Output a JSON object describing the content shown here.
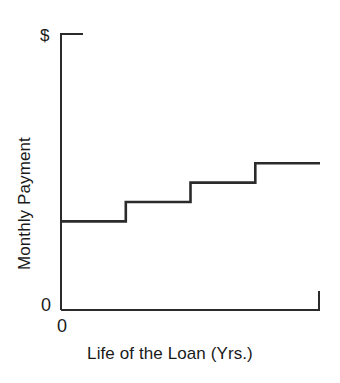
{
  "chart_data": {
    "type": "line",
    "title": "",
    "subtitle": "",
    "xlabel": "Life of the Loan (Yrs.)",
    "ylabel": "Monthly Payment",
    "y_axis_top_tick_label": "$",
    "y_axis_zero_label": "0",
    "x_axis_zero_label": "0",
    "x_tick_labels": [],
    "y_tick_labels": [
      "0",
      "$"
    ],
    "grid": false,
    "legend": null,
    "annotations": [],
    "line_style": "step-post",
    "line_color": "#2b2b2b",
    "axis_color": "#2b2b2b",
    "background_color": "#ffffff",
    "xlim": [
      0,
      4
    ],
    "ylim": [
      0,
      100
    ],
    "x": [
      0,
      1,
      2,
      3,
      4
    ],
    "categories": [
      "Year 1",
      "Year 2",
      "Year 3",
      "Year 4"
    ],
    "values": [
      32,
      39,
      46,
      53
    ],
    "series": [
      {
        "name": "Monthly Payment",
        "values": [
          32,
          39,
          46,
          53
        ]
      }
    ],
    "steps": [
      {
        "index": 1,
        "x_start": 0.0,
        "x_end": 1.0,
        "value": 32
      },
      {
        "index": 2,
        "x_start": 1.0,
        "x_end": 2.0,
        "value": 39
      },
      {
        "index": 3,
        "x_start": 2.0,
        "x_end": 3.0,
        "value": 46
      },
      {
        "index": 4,
        "x_start": 3.0,
        "x_end": 4.0,
        "value": 53
      }
    ]
  }
}
